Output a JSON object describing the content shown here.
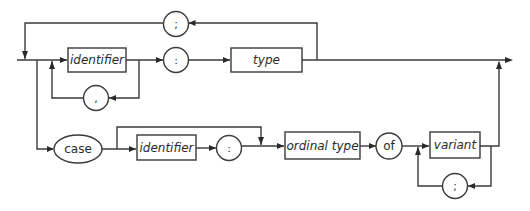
{
  "diagram": {
    "nonterminals": {
      "identifier_1": "identifier",
      "type": "type",
      "identifier_2": "identifier",
      "ordinal_type": "ordinal type",
      "variant": "variant"
    },
    "terminals": {
      "semicolon_top": ";",
      "comma": ",",
      "colon_1": ":",
      "case": "case",
      "colon_2": ":",
      "of": "of",
      "semicolon_bottom": ";"
    },
    "edges": [
      {
        "from": "entry",
        "to": "identifier_1"
      },
      {
        "from": "identifier_1",
        "to": "colon_1"
      },
      {
        "from": "identifier_1",
        "to": "comma",
        "kind": "loop"
      },
      {
        "from": "comma",
        "to": "identifier_1",
        "kind": "loop"
      },
      {
        "from": "colon_1",
        "to": "type"
      },
      {
        "from": "type",
        "to": "semicolon_top",
        "kind": "loop"
      },
      {
        "from": "semicolon_top",
        "to": "entry",
        "kind": "loop"
      },
      {
        "from": "type",
        "to": "exit"
      },
      {
        "from": "entry",
        "to": "case"
      },
      {
        "from": "case",
        "to": "identifier_2"
      },
      {
        "from": "case",
        "to": "ordinal_type",
        "kind": "skip"
      },
      {
        "from": "identifier_2",
        "to": "colon_2"
      },
      {
        "from": "colon_2",
        "to": "ordinal_type"
      },
      {
        "from": "ordinal_type",
        "to": "of"
      },
      {
        "from": "of",
        "to": "variant"
      },
      {
        "from": "variant",
        "to": "semicolon_bottom",
        "kind": "loop"
      },
      {
        "from": "semicolon_bottom",
        "to": "variant",
        "kind": "loop"
      },
      {
        "from": "variant",
        "to": "exit"
      }
    ]
  }
}
